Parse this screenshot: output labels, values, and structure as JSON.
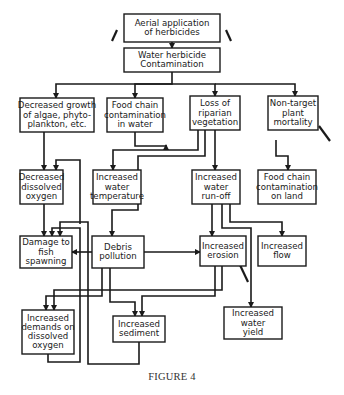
{
  "caption": "FIGURE 4",
  "colors": {
    "line": "#1a1a1a",
    "box_fill": "#ffffff",
    "background": "#ffffff"
  },
  "nodes": [
    {
      "id": "aerial",
      "lines": [
        "Aerial application",
        "of herbicides"
      ]
    },
    {
      "id": "water_contam",
      "lines": [
        "Water herbicide",
        "Contamination"
      ]
    },
    {
      "id": "algae",
      "lines": [
        "Decreased growth",
        "of algae, phyto-",
        "plankton, etc."
      ]
    },
    {
      "id": "food_water",
      "lines": [
        "Food chain",
        "contamination",
        "in water"
      ]
    },
    {
      "id": "riparian",
      "lines": [
        "Loss of",
        "riparian",
        "vegetation"
      ]
    },
    {
      "id": "nontarget",
      "lines": [
        "Non-target",
        "plant",
        "mortality"
      ]
    },
    {
      "id": "dissolved_o2",
      "lines": [
        "Decreased",
        "dissolved",
        "oxygen"
      ]
    },
    {
      "id": "water_temp",
      "lines": [
        "Increased",
        "water",
        "temperature"
      ]
    },
    {
      "id": "runoff",
      "lines": [
        "Increased",
        "water",
        "run-off"
      ]
    },
    {
      "id": "food_land",
      "lines": [
        "Food chain",
        "contamination",
        "on land"
      ]
    },
    {
      "id": "fish",
      "lines": [
        "Damage to",
        "fish",
        "spawning"
      ]
    },
    {
      "id": "debris",
      "lines": [
        "Debris",
        "pollution"
      ]
    },
    {
      "id": "erosion",
      "lines": [
        "Increased",
        "erosion"
      ]
    },
    {
      "id": "flow",
      "lines": [
        "Increased",
        "flow"
      ]
    },
    {
      "id": "demands_o2",
      "lines": [
        "Increased",
        "demands on",
        "dissolved",
        "oxygen"
      ]
    },
    {
      "id": "sediment",
      "lines": [
        "Increased",
        "sediment"
      ]
    },
    {
      "id": "yield",
      "lines": [
        "Increased",
        "water",
        "yield"
      ]
    }
  ],
  "edges": [
    {
      "from": "aerial",
      "to": "water_contam"
    },
    {
      "from": "water_contam",
      "to": "algae"
    },
    {
      "from": "water_contam",
      "to": "food_water"
    },
    {
      "from": "water_contam",
      "to": "riparian"
    },
    {
      "from": "water_contam",
      "to": "nontarget"
    },
    {
      "from": "algae",
      "to": "dissolved_o2"
    },
    {
      "from": "riparian",
      "to": "water_temp"
    },
    {
      "from": "riparian",
      "to": "runoff"
    },
    {
      "from": "riparian",
      "to": "debris"
    },
    {
      "from": "nontarget",
      "to": "food_land"
    },
    {
      "from": "food_water",
      "to": "fish"
    },
    {
      "from": "dissolved_o2",
      "to": "fish"
    },
    {
      "from": "water_temp",
      "to": "dissolved_o2"
    },
    {
      "from": "runoff",
      "to": "erosion"
    },
    {
      "from": "runoff",
      "to": "flow"
    },
    {
      "from": "runoff",
      "to": "yield"
    },
    {
      "from": "debris",
      "to": "fish"
    },
    {
      "from": "debris",
      "to": "erosion"
    },
    {
      "from": "debris",
      "to": "demands_o2"
    },
    {
      "from": "debris",
      "to": "sediment"
    },
    {
      "from": "erosion",
      "to": "sediment"
    },
    {
      "from": "erosion",
      "to": "demands_o2"
    },
    {
      "from": "sediment",
      "to": "fish"
    },
    {
      "from": "demands_o2",
      "to": "fish"
    }
  ]
}
